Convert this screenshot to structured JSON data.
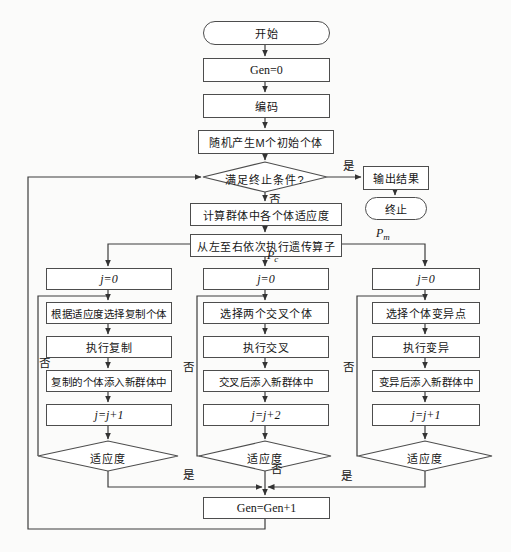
{
  "colors": {
    "background": "#fbfbfa",
    "line": "#3c3c3c",
    "box_border": "#4d4d4d",
    "box_fill": "#ffffff",
    "text": "#161616"
  },
  "top": {
    "start": "开始",
    "gen_init": "Gen=0",
    "encode": "编码",
    "init_population": "随机产生M个初始个体",
    "termination_condition": "满足终止条件?",
    "yes_label": "是",
    "no_label": "否",
    "output_result": "输出结果",
    "end": "终止",
    "fitness_calc": "计算群体中各个体适应度",
    "dispatch": "从左至右依次执行遗传算子"
  },
  "edge_labels": {
    "p": "P",
    "pc_sub": "c",
    "pm_sub": "m"
  },
  "columns": {
    "left": {
      "j_init": "j=0",
      "step1": "根据适应度选择复制个体",
      "step2": "执行复制",
      "step3": "复制的个体添入新群体中",
      "j_inc": "j=j+1",
      "check": "适应度",
      "loop_label": "否",
      "exit_label": "是"
    },
    "middle": {
      "j_init": "j=0",
      "step1": "选择两个交叉个体",
      "step2": "执行交叉",
      "step3": "交叉后添入新群体中",
      "j_inc": "j=j+2",
      "check": "适应度",
      "loop_label": "否",
      "exit_label": "否"
    },
    "right": {
      "j_init": "j=0",
      "step1": "选择个体变异点",
      "step2": "执行变异",
      "step3": "变异后添入新群体中",
      "j_inc": "j=j+1",
      "check": "适应度",
      "loop_label": "否",
      "exit_label": "是"
    }
  },
  "bottom": {
    "gen_increment": "Gen=Gen+1"
  }
}
